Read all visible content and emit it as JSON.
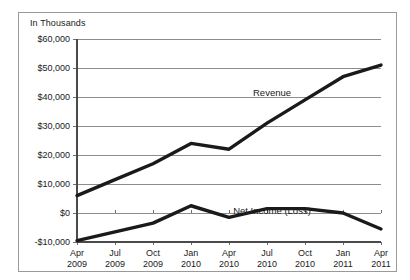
{
  "chart_data": {
    "type": "line",
    "title": "",
    "unit_caption": "In Thousands",
    "xlabel": "",
    "ylabel": "",
    "ylim": [
      -10000,
      60000
    ],
    "grid": true,
    "legend_position": "inline-annotation",
    "categories": [
      "Apr 2009",
      "Jul 2009",
      "Oct 2009",
      "Jan 2010",
      "Apr 2010",
      "Jul 2010",
      "Oct 2010",
      "Jan 2011",
      "Apr 2011"
    ],
    "category_lines": [
      {
        "month": "Apr",
        "year": "2009"
      },
      {
        "month": "Jul",
        "year": "2009"
      },
      {
        "month": "Oct",
        "year": "2009"
      },
      {
        "month": "Jan",
        "year": "2010"
      },
      {
        "month": "Apr",
        "year": "2010"
      },
      {
        "month": "Jul",
        "year": "2010"
      },
      {
        "month": "Oct",
        "year": "2010"
      },
      {
        "month": "Jan",
        "year": "2011"
      },
      {
        "month": "Apr",
        "year": "2011"
      }
    ],
    "ytick_values": [
      60000,
      50000,
      40000,
      30000,
      20000,
      10000,
      0,
      -10000
    ],
    "ytick_labels": [
      "$60,000",
      "$50,000",
      "$40,000",
      "$30,000",
      "$20,000",
      "$10,000",
      "$0",
      "-$10,000"
    ],
    "series": [
      {
        "name": "Revenue",
        "label": "Revenue",
        "color": "#1a1a1a",
        "values": [
          6000,
          11500,
          17000,
          24000,
          22000,
          31000,
          39000,
          47000,
          51000
        ]
      },
      {
        "name": "Net Income (Loss)",
        "label": "Net Income (Loss)",
        "color": "#1a1a1a",
        "values": [
          -9500,
          -6500,
          -3500,
          2500,
          -1500,
          1500,
          1500,
          0,
          -5500
        ]
      }
    ],
    "annotations": [
      {
        "text": "Revenue",
        "series": "Revenue",
        "x": 253,
        "y": 83
      },
      {
        "text": "Net Income (Loss)",
        "series": "Net Income (Loss)",
        "x": 253,
        "y": 201
      }
    ]
  }
}
